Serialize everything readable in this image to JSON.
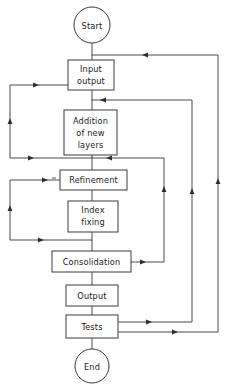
{
  "diagram": {
    "background_color": "#ffffff",
    "line_color": "#4a4a4a",
    "text_color": "#1a1a1a",
    "nodes": {
      "start": {
        "label": "Start",
        "shape": "circle"
      },
      "input_output": {
        "label_line1": "Input",
        "label_line2": "output",
        "shape": "rectangle"
      },
      "addition": {
        "label_line1": "Addition",
        "label_line2": "of new",
        "label_line3": "layers",
        "shape": "rectangle"
      },
      "refinement": {
        "label": "Refinement",
        "shape": "rectangle"
      },
      "index_fixing": {
        "label_line1": "Index",
        "label_line2": "fixing",
        "shape": "rectangle"
      },
      "consolidation": {
        "label": "Consolidation",
        "shape": "rectangle"
      },
      "output": {
        "label": "Output",
        "shape": "rectangle"
      },
      "tests": {
        "label": "Tests",
        "shape": "rectangle"
      },
      "end": {
        "label": "End",
        "shape": "circle"
      }
    },
    "edges": [
      {
        "id": "start-to-input",
        "from": "start",
        "to": "input_output",
        "kind": "straight-down"
      },
      {
        "id": "input-to-addition",
        "from": "input_output",
        "to": "addition",
        "kind": "straight-down"
      },
      {
        "id": "addition-to-refinement",
        "from": "addition",
        "to": "refinement",
        "kind": "straight-down"
      },
      {
        "id": "refinement-to-index",
        "from": "refinement",
        "to": "index_fixing",
        "kind": "straight-down"
      },
      {
        "id": "index-to-consolidation",
        "from": "index_fixing",
        "to": "consolidation",
        "kind": "straight-down"
      },
      {
        "id": "consolidation-to-output",
        "from": "consolidation",
        "to": "output",
        "kind": "straight-down"
      },
      {
        "id": "output-to-tests",
        "from": "output",
        "to": "tests",
        "kind": "straight-down"
      },
      {
        "id": "tests-to-end",
        "from": "tests",
        "to": "end",
        "kind": "straight-down"
      },
      {
        "id": "addition-loop-back-to-input",
        "from": "addition",
        "to": "input_output",
        "kind": "left-loop"
      },
      {
        "id": "index-loop-back-to-refinement",
        "from": "index_fixing",
        "to": "refinement",
        "kind": "left-loop"
      },
      {
        "id": "consolidation-loop-back-to-addition",
        "from": "consolidation",
        "to": "addition",
        "kind": "right-loop"
      },
      {
        "id": "tests-loop-back-to-refinement",
        "from": "tests",
        "to": "refinement",
        "kind": "right-loop"
      },
      {
        "id": "tests-loop-back-to-input",
        "from": "tests",
        "to": "input_output",
        "kind": "right-loop"
      }
    ]
  }
}
